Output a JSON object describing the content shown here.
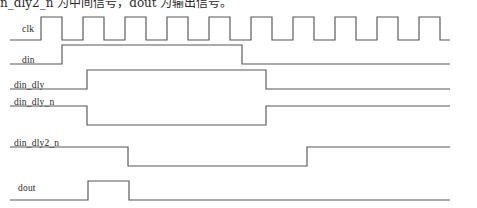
{
  "caption": {
    "text": "n_dly2_n 为中间信号，dout 为输出信号。"
  },
  "diagram": {
    "stroke_color": "#575757",
    "background_color": "#ffffff",
    "axis": {
      "x_start": 10,
      "x_end": 450,
      "clock_period_px": 42,
      "clock_first_rise_px": 41
    },
    "signals": [
      {
        "name": "clk",
        "label": "clk",
        "label_x": 22,
        "label_y": 29,
        "baseline_y": 40,
        "high_y": 17,
        "type": "clock",
        "initial_level": "low",
        "edges": [
          41,
          62,
          83,
          104,
          125,
          146,
          167,
          188,
          209,
          230,
          251,
          272,
          293,
          314,
          335,
          356,
          377,
          398,
          419,
          440
        ],
        "pulse_count": 10
      },
      {
        "name": "din",
        "label": "din",
        "label_x": 22,
        "label_y": 61,
        "baseline_y": 64,
        "high_y": 45,
        "type": "level",
        "initial_level": "low",
        "rise_x": 62,
        "fall_x": 242
      },
      {
        "name": "din_dly",
        "label": "din_dly",
        "label_x": 14,
        "label_y": 86,
        "baseline_y": 89,
        "high_y": 70,
        "type": "level",
        "initial_level": "low",
        "rise_x": 87,
        "fall_x": 266
      },
      {
        "name": "din_dly_n",
        "label": "din_dly_n",
        "label_x": 14,
        "label_y": 103,
        "baseline_y": 125,
        "high_y": 106,
        "type": "level",
        "initial_level": "high",
        "fall_x": 87,
        "rise_x": 266
      },
      {
        "name": "din_dly2_n",
        "label": "din_dly2_n",
        "label_x": 14,
        "label_y": 144,
        "baseline_y": 166,
        "high_y": 147,
        "type": "level",
        "initial_level": "high",
        "fall_x": 128,
        "rise_x": 307
      },
      {
        "name": "dout",
        "label": "dout",
        "label_x": 18,
        "label_y": 190,
        "baseline_y": 200,
        "high_y": 181,
        "type": "pulse",
        "initial_level": "low",
        "rise_x": 88,
        "fall_x": 129
      }
    ]
  }
}
